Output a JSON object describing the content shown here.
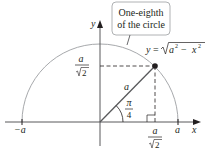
{
  "diagram": {
    "callout": {
      "line1": "One-eighth",
      "line2": "of the circle"
    },
    "curve_label": {
      "y": "y",
      "eq": "=",
      "a": "a",
      "sup2a": "2",
      "minus": "−",
      "x": "x",
      "sup2x": "2"
    },
    "axes": {
      "x_label": "x",
      "y_label": "y"
    },
    "ticks": {
      "neg_a": "−a",
      "pos_a": "a"
    },
    "y_tick": {
      "num": "a",
      "den": "2"
    },
    "x_tick": {
      "num": "a",
      "den": "2"
    },
    "radius_label": "a",
    "angle_label": {
      "num": "π",
      "den": "4"
    },
    "colors": {
      "circle": "#a7a9ac",
      "axis": "#58595b",
      "ink": "#231f20",
      "callout_border": "#a7a9ac"
    }
  }
}
